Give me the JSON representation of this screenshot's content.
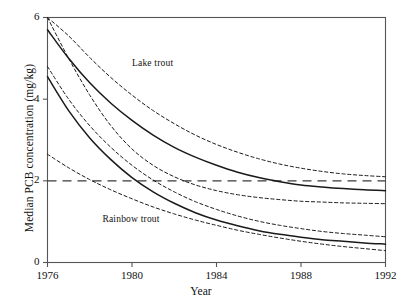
{
  "figure": {
    "background": "#ffffff",
    "line_color": "#1a1a1a",
    "frame_color": "#555555"
  },
  "chart_data": {
    "type": "line",
    "title": "",
    "xlabel": "Year",
    "ylabel": "Median PCB concentration (mg/kg)",
    "xlim": [
      1976,
      1992
    ],
    "ylim": [
      0,
      6
    ],
    "xticks": [
      1976,
      1980,
      1984,
      1988,
      1992
    ],
    "xtick_labels": [
      "1976",
      "1980",
      "1984",
      "1988",
      "1992"
    ],
    "yticks": [
      0,
      2,
      4,
      6
    ],
    "ytick_labels": [
      "0",
      "2",
      "4",
      "6"
    ],
    "grid": false,
    "legend": "none",
    "annotations": [
      {
        "text": "Lake trout",
        "x": 1980.0,
        "y": 4.85
      },
      {
        "text": "Rainbow trout",
        "x": 1978.6,
        "y": 1.05
      }
    ],
    "reference_lines": [
      {
        "label": "guideline",
        "orientation": "horizontal",
        "y": 2.0,
        "style": "long-dashed"
      }
    ],
    "x": [
      1976,
      1977,
      1978,
      1979,
      1980,
      1981,
      1982,
      1983,
      1984,
      1985,
      1986,
      1987,
      1988,
      1989,
      1990,
      1991,
      1992
    ],
    "series": [
      {
        "name": "Lake trout median",
        "style": "solid",
        "values": [
          5.7,
          5.0,
          4.4,
          3.9,
          3.48,
          3.12,
          2.82,
          2.58,
          2.38,
          2.21,
          2.08,
          1.98,
          1.9,
          1.85,
          1.81,
          1.78,
          1.76
        ]
      },
      {
        "name": "Lake trout upper confidence limit",
        "style": "dashed",
        "values": [
          6.0,
          5.55,
          5.02,
          4.53,
          4.1,
          3.72,
          3.4,
          3.12,
          2.89,
          2.7,
          2.54,
          2.41,
          2.31,
          2.23,
          2.17,
          2.13,
          2.1
        ]
      },
      {
        "name": "Lake trout lower confidence limit",
        "style": "dashed",
        "values": [
          6.0,
          5.0,
          4.1,
          3.35,
          2.78,
          2.38,
          2.1,
          1.9,
          1.76,
          1.66,
          1.59,
          1.54,
          1.5,
          1.48,
          1.46,
          1.45,
          1.44
        ]
      },
      {
        "name": "Rainbow trout median",
        "style": "solid",
        "values": [
          4.55,
          3.72,
          3.05,
          2.52,
          2.08,
          1.73,
          1.45,
          1.22,
          1.04,
          0.9,
          0.78,
          0.69,
          0.62,
          0.56,
          0.52,
          0.48,
          0.45
        ]
      },
      {
        "name": "Rainbow trout upper confidence limit",
        "style": "dashed",
        "values": [
          4.8,
          4.0,
          3.35,
          2.82,
          2.38,
          2.02,
          1.73,
          1.49,
          1.3,
          1.14,
          1.01,
          0.91,
          0.83,
          0.76,
          0.71,
          0.67,
          0.63
        ]
      },
      {
        "name": "Rainbow trout lower confidence limit",
        "style": "dashed",
        "values": [
          2.65,
          2.32,
          2.03,
          1.78,
          1.56,
          1.36,
          1.19,
          1.04,
          0.91,
          0.79,
          0.69,
          0.6,
          0.52,
          0.45,
          0.39,
          0.34,
          0.29
        ]
      }
    ]
  }
}
